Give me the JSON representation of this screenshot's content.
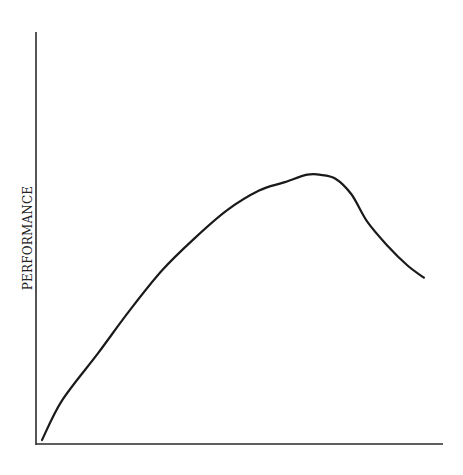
{
  "chart_data": {
    "type": "line",
    "title": "",
    "xlabel": "",
    "ylabel": "PERFORMANCE",
    "grid": false,
    "legend": null,
    "ticks": {
      "x": [],
      "y": []
    },
    "xlim": [
      0,
      100
    ],
    "ylim": [
      0,
      100
    ],
    "series": [
      {
        "name": "performance",
        "x": [
          1,
          6,
          15,
          23,
          31,
          39,
          47,
          55,
          61,
          67,
          70,
          74,
          78,
          82,
          87,
          92,
          96
        ],
        "y": [
          1,
          11,
          23,
          34,
          44,
          52,
          59,
          64,
          66,
          68,
          68,
          67,
          63,
          56,
          50,
          45,
          42
        ]
      }
    ]
  }
}
